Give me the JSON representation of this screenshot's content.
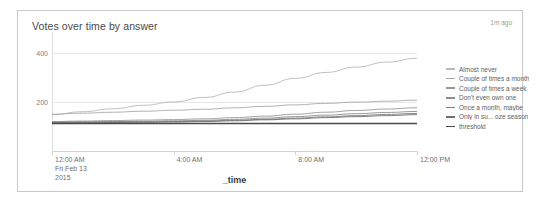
{
  "panel": {
    "title": "Votes over time by answer",
    "refresh_stamp": "1m ago"
  },
  "chart_data": {
    "type": "line",
    "title": "Votes over time by answer",
    "xlabel": "_time",
    "ylabel": "",
    "grid": true,
    "legend_position": "right",
    "xlim": [
      0,
      12
    ],
    "ylim": [
      0,
      440
    ],
    "yticks": [
      200,
      400
    ],
    "xticks": [
      "12:00 AM",
      "4:00 AM",
      "8:00 AM",
      "12:00 PM"
    ],
    "xtick_sublabels": [
      "Fri Feb 13",
      "2015"
    ],
    "x": [
      0,
      1,
      2,
      3,
      4,
      5,
      6,
      7,
      8,
      9,
      10,
      11,
      12
    ],
    "series": [
      {
        "name": "Almost never",
        "color": "#b9b9b9",
        "values": [
          148,
          160,
          172,
          186,
          200,
          218,
          240,
          268,
          296,
          320,
          342,
          362,
          378
        ]
      },
      {
        "name": "Couple of times a month",
        "color": "#a8a8a8",
        "values": [
          150,
          154,
          158,
          162,
          166,
          170,
          176,
          182,
          188,
          194,
          199,
          203,
          207
        ]
      },
      {
        "name": "Couple of times a week",
        "color": "#989898",
        "values": [
          120,
          122,
          124,
          126,
          128,
          131,
          136,
          142,
          150,
          158,
          165,
          171,
          176
        ]
      },
      {
        "name": "Don't even own one",
        "color": "#8c8c8c",
        "values": [
          118,
          119,
          120,
          121,
          123,
          125,
          129,
          134,
          140,
          146,
          152,
          157,
          161
        ]
      },
      {
        "name": "Once a month, maybe",
        "color": "#7d7d7d",
        "values": [
          116,
          117,
          118,
          119,
          120,
          122,
          125,
          129,
          134,
          139,
          144,
          149,
          153
        ]
      },
      {
        "name": "Only in su... oze season",
        "color": "#6e6e6e",
        "values": [
          114,
          115,
          116,
          117,
          118,
          120,
          123,
          127,
          131,
          136,
          140,
          144,
          148
        ]
      },
      {
        "name": "threshold",
        "color": "#4a4a4a",
        "values": [
          112,
          112,
          112,
          112,
          112,
          112,
          112,
          112,
          112,
          112,
          112,
          112,
          112
        ]
      }
    ]
  }
}
